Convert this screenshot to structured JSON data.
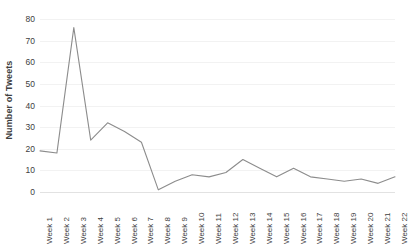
{
  "chart_data": {
    "type": "line",
    "title": "",
    "xlabel": "",
    "ylabel": "Number of Tweets",
    "categories": [
      "Week 1",
      "Week 2",
      "Week 3",
      "Week 4",
      "Week 5",
      "Week 6",
      "Week 7",
      "Week 8",
      "Week 9",
      "Week 10",
      "Week 11",
      "Week 12",
      "Week 13",
      "Week 14",
      "Week 15",
      "Week 16",
      "Week 17",
      "Week 18",
      "Week 19",
      "Week 20",
      "Week 21",
      "Week 22"
    ],
    "values": [
      19,
      18,
      76,
      24,
      32,
      28,
      23,
      1,
      5,
      8,
      7,
      9,
      15,
      11,
      7,
      11,
      7,
      6,
      5,
      6,
      4,
      7
    ],
    "ylim": [
      0,
      80
    ],
    "ytick_values": [
      0,
      10,
      20,
      30,
      40,
      50,
      60,
      70,
      80
    ],
    "ytick_labels": [
      "0",
      "10",
      "20",
      "30",
      "40",
      "50",
      "60",
      "70",
      "80"
    ],
    "grid": true,
    "grid_axis": "y",
    "legend": false,
    "legend_position": "none",
    "series_color": "#8c8c8c",
    "gridline_color": "#f2f2f2",
    "background_color": "#ffffff",
    "text_color": "#404040",
    "line_width": 1.1,
    "markers": false,
    "xtick_rotation": -90
  }
}
